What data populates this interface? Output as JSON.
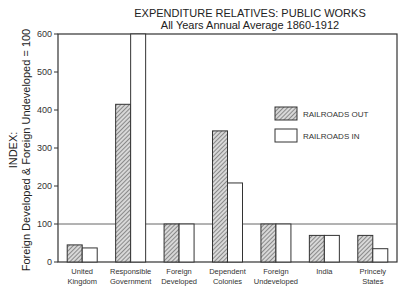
{
  "chart_data": {
    "type": "bar",
    "title": "EXPENDITURE RELATIVES: PUBLIC WORKS",
    "subtitle": "All Years Annual Average 1860-1912",
    "xlabel": "",
    "ylabel": "INDEX: Foreign Developed & Foreign Undeveloped = 100",
    "ylabel_lines": [
      "INDEX:",
      "Foreign Developed & Foreign Undeveloped = 100"
    ],
    "ylim": [
      0,
      600
    ],
    "yticks": [
      0,
      100,
      200,
      300,
      400,
      500,
      600
    ],
    "reference_line": 100,
    "grid": false,
    "legend_position": "upper right",
    "categories": [
      [
        "United",
        "Kingdom"
      ],
      [
        "Responsible",
        "Government"
      ],
      [
        "Foreign",
        "Developed"
      ],
      [
        "Dependent",
        "Colonies"
      ],
      [
        "Foreign",
        "Undeveloped"
      ],
      [
        "India"
      ],
      [
        "Princely",
        "States"
      ]
    ],
    "series": [
      {
        "name": "RAILROADS OUT",
        "pattern": "hatched",
        "values": [
          45,
          415,
          100,
          345,
          100,
          70,
          70
        ]
      },
      {
        "name": "RAILROADS IN",
        "pattern": "open",
        "values": [
          37,
          600,
          100,
          208,
          100,
          70,
          35
        ]
      }
    ],
    "colors": {
      "axis": "#333333",
      "hatch": "#555555",
      "fill_open": "#ffffff"
    }
  }
}
